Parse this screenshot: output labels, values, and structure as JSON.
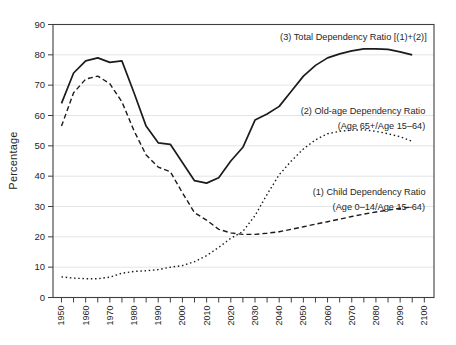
{
  "figure": {
    "background": "#ffffff",
    "frame_color": "#3f3f3f",
    "grid_color": "#dedede",
    "text_color": "#262626",
    "line_color": "#1b1b1b"
  },
  "chart_data": {
    "type": "line",
    "title": "",
    "xlabel": "",
    "ylabel": "Percentage",
    "xlim": [
      1946.5,
      2104
    ],
    "ylim": [
      0,
      90
    ],
    "y_ticks": [
      0,
      10,
      20,
      30,
      40,
      50,
      60,
      70,
      80,
      90
    ],
    "x_tick_labels": [
      "1950",
      "1960",
      "1970",
      "1980",
      "1990",
      "2000",
      "2010",
      "2020",
      "2030",
      "2040",
      "2050",
      "2060",
      "2070",
      "2080",
      "2090",
      "2100"
    ],
    "x_minor_tick_step": 5,
    "grid": "horizontal light gridlines at every 10",
    "legend_position": "inline annotations",
    "x": [
      1950,
      1955,
      1960,
      1965,
      1970,
      1975,
      1980,
      1985,
      1990,
      1995,
      2000,
      2005,
      2010,
      2015,
      2020,
      2025,
      2030,
      2035,
      2040,
      2045,
      2050,
      2055,
      2060,
      2065,
      2070,
      2075,
      2080,
      2085,
      2090,
      2095
    ],
    "series": [
      {
        "key": "total",
        "name": "(3) Total Dependency Ratio [(1)+(2)]",
        "style": "solid",
        "values": [
          64,
          74,
          78,
          79,
          77.5,
          78,
          67.5,
          56.5,
          51,
          50.5,
          44.5,
          38.5,
          37.7,
          39.5,
          45,
          49.5,
          58.5,
          60.5,
          63,
          68,
          73,
          76.5,
          79,
          80.3,
          81.3,
          82,
          82,
          81.8,
          81,
          80
        ]
      },
      {
        "key": "old_age",
        "name": "(2) Old-age Dependency Ratio (Age 65+/Age 15–64)",
        "style": "dotted",
        "values": [
          6.8,
          6.4,
          6.2,
          6.2,
          6.7,
          8,
          8.6,
          8.8,
          9.2,
          10,
          10.5,
          11.8,
          13.8,
          16.5,
          19.5,
          21.8,
          27,
          34,
          40.5,
          45,
          49,
          52,
          54,
          54.8,
          55.2,
          55.3,
          54.8,
          54,
          53,
          51.5
        ]
      },
      {
        "key": "child",
        "name": "(1) Child Dependency Ratio (Age 0–14/Age 15–64)",
        "style": "dashed",
        "values": [
          56.5,
          67.5,
          72,
          73,
          70.5,
          64.5,
          55,
          47,
          43,
          41.5,
          34.5,
          28,
          25.5,
          22.5,
          21.3,
          20.8,
          20.8,
          21.2,
          21.7,
          22.5,
          23.3,
          24.2,
          25,
          25.8,
          26.7,
          27.5,
          28.2,
          28.8,
          29.4,
          29.8
        ]
      }
    ],
    "annotations": [
      {
        "text": "(3) Total Dependency Ratio [(1)+(2)]",
        "x": 2101.0,
        "y": 84.8,
        "anchor": "end"
      },
      {
        "text": "(2) Old-age Dependency Ratio",
        "x": 2100.4,
        "y": 60.4,
        "anchor": "end"
      },
      {
        "text": "(Age 65+/Age 15–64)",
        "x": 2100.4,
        "y": 55.4,
        "anchor": "end"
      },
      {
        "text": "(1) Child Dependency Ratio",
        "x": 2100.5,
        "y": 33.7,
        "anchor": "end"
      },
      {
        "text": "(Age 0–14/Age 15–64)",
        "x": 2100.3,
        "y": 29.0,
        "anchor": "end"
      }
    ]
  }
}
